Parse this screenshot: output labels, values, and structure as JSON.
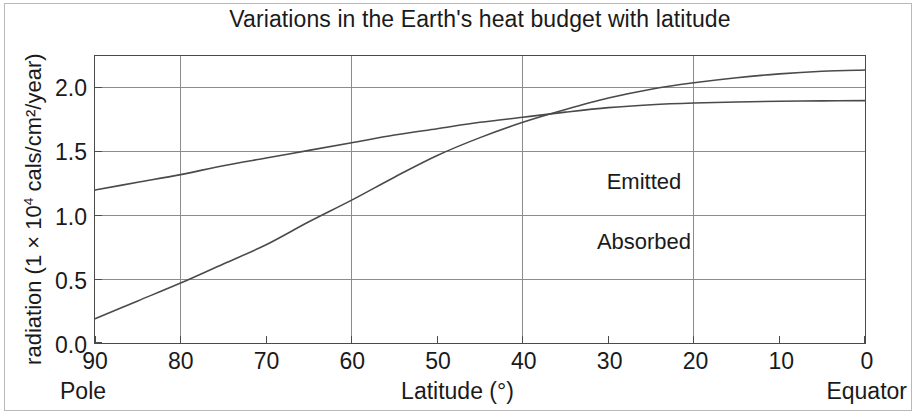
{
  "figure": {
    "title": "Variations in the Earth's heat budget with latitude",
    "y_axis_title_prefix": "radiation (1 × 10",
    "y_axis_title_sup": "4",
    "y_axis_title_suffix": " cals/cm²/year)",
    "x_axis_caption_left": "Pole",
    "x_axis_caption_center": "Latitude (°)",
    "x_axis_caption_right": "Equator",
    "line_color": "#4a4a4a",
    "grid_color": "#8c8c8c",
    "axis_color": "#4a4a4a",
    "text_color": "#1a1a1a"
  },
  "chart_data": {
    "type": "line",
    "title": "Variations in the Earth's heat budget with latitude",
    "xlabel": "Latitude (°)",
    "ylabel": "radiation (1 × 10⁴ cals/cm²/year)",
    "xlim": [
      90,
      0
    ],
    "ylim": [
      0.0,
      2.25
    ],
    "x_axis_reversed": true,
    "grid": true,
    "legend": "inline-annotations",
    "x_tick_labels": [
      "90",
      "80",
      "70",
      "60",
      "50",
      "40",
      "30",
      "20",
      "10",
      "0"
    ],
    "x_tick_values": [
      90,
      80,
      70,
      60,
      50,
      40,
      30,
      20,
      10,
      0
    ],
    "x_gridline_values": [
      80,
      60,
      40,
      20,
      0
    ],
    "y_tick_labels": [
      "0.0",
      "0.5",
      "1.0",
      "1.5",
      "2.0"
    ],
    "y_tick_values": [
      0.0,
      0.5,
      1.0,
      1.5,
      2.0
    ],
    "y_gridline_values": [
      0.5,
      1.0,
      1.5,
      2.0
    ],
    "annotations": [
      {
        "text": "Emitted",
        "x": 26,
        "y": 1.27
      },
      {
        "text": "Absorbed",
        "x": 26,
        "y": 0.8
      }
    ],
    "series": [
      {
        "name": "Emitted",
        "x": [
          90,
          85,
          80,
          75,
          70,
          65,
          60,
          55,
          50,
          45,
          40,
          35,
          30,
          25,
          20,
          15,
          10,
          5,
          0
        ],
        "values": [
          1.2,
          1.26,
          1.32,
          1.39,
          1.45,
          1.51,
          1.57,
          1.63,
          1.68,
          1.73,
          1.77,
          1.81,
          1.845,
          1.868,
          1.882,
          1.89,
          1.895,
          1.898,
          1.9
        ]
      },
      {
        "name": "Absorbed",
        "x": [
          90,
          85,
          80,
          75,
          70,
          65,
          60,
          55,
          50,
          45,
          40,
          35,
          30,
          25,
          20,
          15,
          10,
          5,
          0
        ],
        "values": [
          0.19,
          0.33,
          0.47,
          0.62,
          0.77,
          0.95,
          1.12,
          1.3,
          1.47,
          1.61,
          1.73,
          1.83,
          1.92,
          1.99,
          2.04,
          2.08,
          2.11,
          2.13,
          2.14
        ]
      }
    ]
  }
}
